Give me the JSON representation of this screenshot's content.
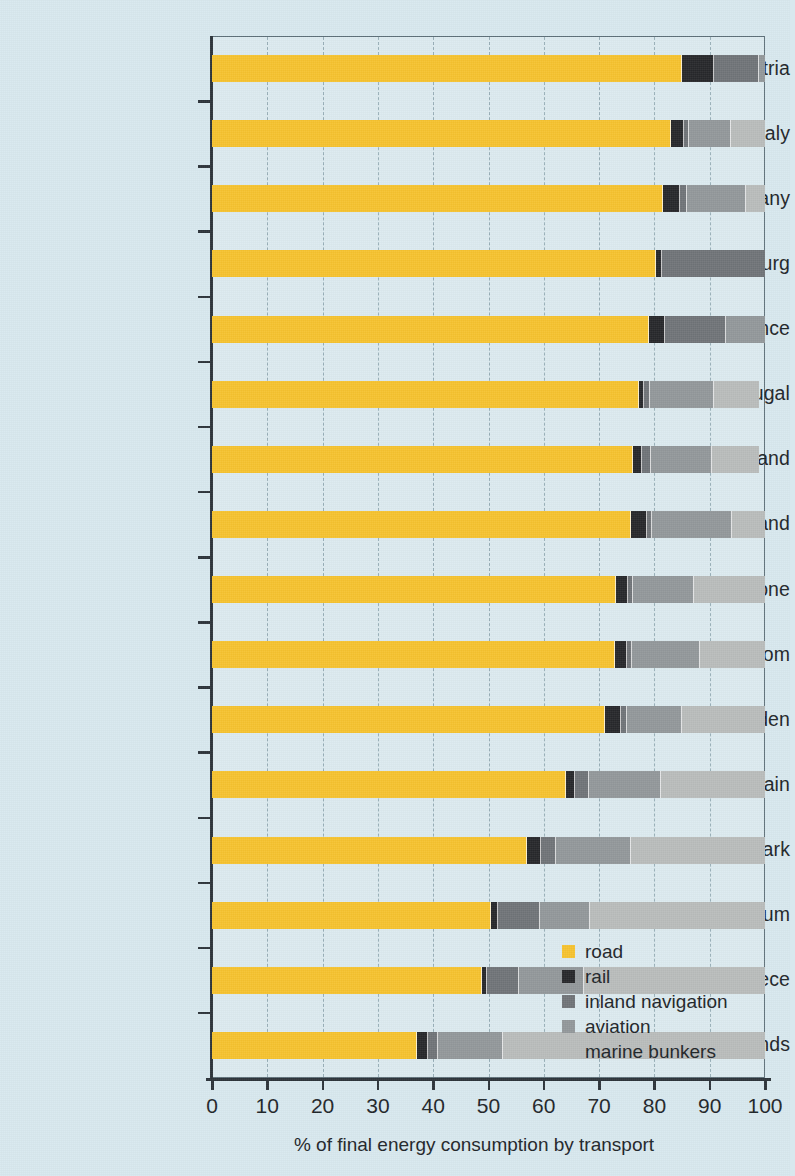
{
  "chart_data": {
    "type": "bar",
    "orientation": "horizontal",
    "stacked": true,
    "title": "",
    "xlabel": "% of final energy consumption by transport",
    "ylabel": "",
    "xlim": [
      0,
      100
    ],
    "xticks": [
      0,
      10,
      20,
      30,
      40,
      50,
      60,
      70,
      80,
      90,
      100
    ],
    "xtick_labels": [
      "0",
      "10",
      "20",
      "30",
      "40",
      "50",
      "60",
      "70",
      "80",
      "90",
      "100"
    ],
    "grid": "vertical-dashed",
    "legend_position": "inside-bottom-right",
    "categories": [
      "Austria",
      "Italy",
      "Germany",
      "Luxembourg",
      "France",
      "Portugal",
      "Finland",
      "Ireland",
      "Eurozone",
      "United Kingdom",
      "Sweden",
      "Spain",
      "Denmark",
      "Belgium",
      "Greece",
      "The Netherlands"
    ],
    "series": [
      {
        "name": "road",
        "color": "#f6c22e",
        "values": [
          85.0,
          83.0,
          81.5,
          80.2,
          79.0,
          77.2,
          76.2,
          75.8,
          73.0,
          72.8,
          71.0,
          64.0,
          57.0,
          50.5,
          48.8,
          37.0
        ]
      },
      {
        "name": "rail",
        "color": "#26272a",
        "values": [
          5.8,
          2.3,
          3.2,
          1.2,
          3.0,
          1.0,
          1.6,
          2.8,
          2.2,
          2.2,
          3.0,
          1.7,
          2.5,
          1.3,
          1.0,
          2.0
        ]
      },
      {
        "name": "inland navigation",
        "color": "#6f7377",
        "values": [
          8.2,
          1.0,
          1.2,
          18.6,
          11.0,
          1.0,
          1.6,
          1.0,
          1.0,
          1.0,
          1.0,
          2.5,
          2.8,
          7.5,
          5.8,
          1.8
        ]
      },
      {
        "name": "aviation",
        "color": "#92979a",
        "values": [
          1.0,
          7.5,
          10.6,
          0.0,
          7.0,
          11.5,
          11.0,
          14.4,
          11.0,
          12.2,
          10.0,
          13.0,
          13.5,
          9.0,
          11.6,
          11.8
        ]
      },
      {
        "name": "marine bunkers",
        "color": "#b9bcbb",
        "values": [
          0.0,
          6.2,
          3.5,
          0.0,
          0.0,
          8.3,
          8.6,
          6.0,
          12.8,
          11.8,
          15.0,
          18.8,
          24.2,
          31.7,
          32.8,
          47.4
        ]
      }
    ],
    "legend": [
      {
        "label": "road",
        "color": "#f6c22e"
      },
      {
        "label": "rail",
        "color": "#26272a"
      },
      {
        "label": "inland navigation",
        "color": "#6f7377"
      },
      {
        "label": "aviation",
        "color": "#92979a"
      },
      {
        "label": "marine bunkers",
        "color": "#b9bcbb"
      }
    ],
    "background_color": "#d8e8ee",
    "axis_color": "#2c3339"
  }
}
